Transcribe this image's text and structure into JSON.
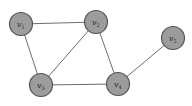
{
  "diagram": {
    "type": "graph",
    "directed": false,
    "colors": {
      "node_fill": "#9c9c9c",
      "node_stroke": "#555555",
      "edge": "#6e6e6e",
      "background": "#ffffff"
    },
    "nodes": [
      {
        "id": "v1",
        "label": "v",
        "sub": "1",
        "x": 21,
        "y": 24
      },
      {
        "id": "v2",
        "label": "v",
        "sub": "2",
        "x": 96,
        "y": 22
      },
      {
        "id": "v3",
        "label": "v",
        "sub": "3",
        "x": 41,
        "y": 85
      },
      {
        "id": "v4",
        "label": "v",
        "sub": "4",
        "x": 118,
        "y": 84
      },
      {
        "id": "v5",
        "label": "v",
        "sub": "5",
        "x": 173,
        "y": 38
      }
    ],
    "edges": [
      [
        "v1",
        "v2"
      ],
      [
        "v1",
        "v3"
      ],
      [
        "v2",
        "v3"
      ],
      [
        "v2",
        "v4"
      ],
      [
        "v3",
        "v4"
      ],
      [
        "v4",
        "v5"
      ]
    ]
  }
}
